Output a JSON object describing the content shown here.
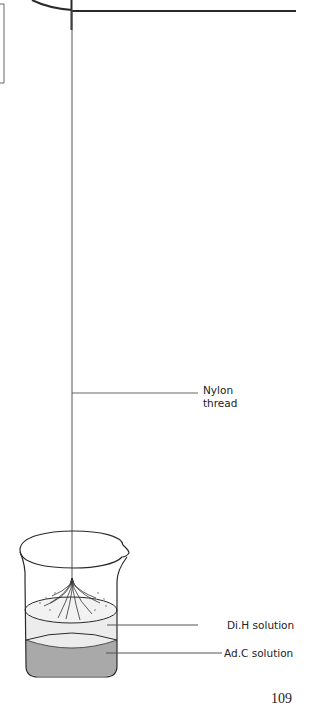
{
  "figure": {
    "labels": {
      "nylon_thread": [
        "Nylon",
        "thread"
      ],
      "upper_layer": "Di.H solution",
      "lower_layer": "Ad.C solution"
    },
    "colors": {
      "line": "#2a2a2a",
      "thread": "#555555",
      "upper_liquid": "#ececec",
      "lower_liquid": "#a9a9a9"
    }
  },
  "page": {
    "number": "109"
  }
}
